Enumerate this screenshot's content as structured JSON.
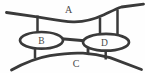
{
  "diagram": {
    "type": "multigraph-diagram",
    "background": "#fefefe",
    "stroke_color": "#3a3a3a",
    "label_color": "#4b4b4b",
    "labels": {
      "top_curve": "A",
      "left_ellipse": "B",
      "bottom_curve": "C",
      "right_ellipse": "D"
    },
    "nodes": [
      {
        "id": "A",
        "shape": "curve",
        "position": "top"
      },
      {
        "id": "B",
        "shape": "ellipse",
        "position": "middle-left"
      },
      {
        "id": "C",
        "shape": "curve",
        "position": "bottom"
      },
      {
        "id": "D",
        "shape": "ellipse",
        "position": "middle-right"
      }
    ],
    "edges": [
      {
        "from": "A",
        "to": "B",
        "links": 1
      },
      {
        "from": "A",
        "to": "D",
        "links": 2
      },
      {
        "from": "B",
        "to": "D",
        "links": 1
      },
      {
        "from": "B",
        "to": "C",
        "links": 1
      },
      {
        "from": "C",
        "to": "D",
        "links": 2
      }
    ]
  }
}
